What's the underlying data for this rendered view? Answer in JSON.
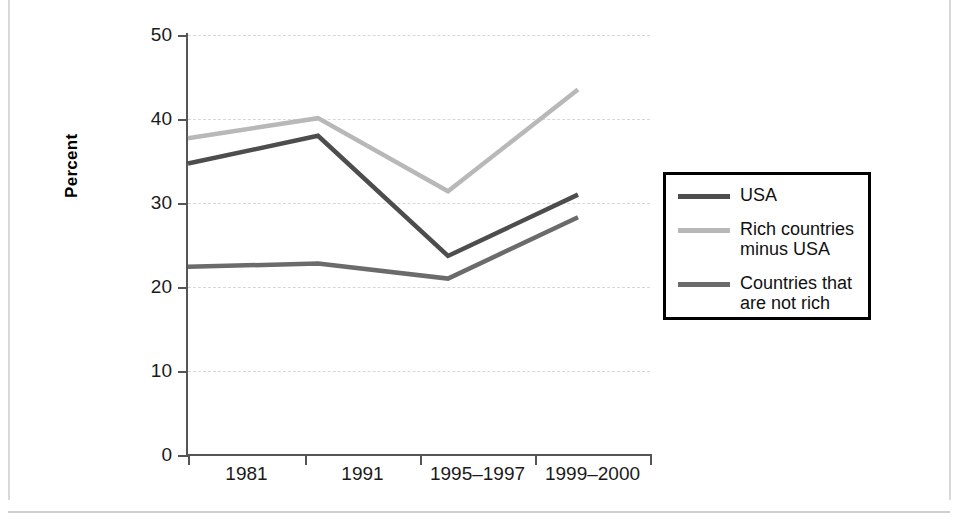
{
  "chart_data": {
    "type": "line",
    "title": "",
    "xlabel": "",
    "ylabel": "Percent",
    "categories": [
      "1981",
      "1991",
      "1995–1997",
      "1999–2000"
    ],
    "ylim": [
      0,
      50
    ],
    "yticks": [
      0,
      10,
      20,
      30,
      40,
      50
    ],
    "grid": true,
    "legend_position": "right",
    "series": [
      {
        "name": "USA",
        "color": "#4d4d4d",
        "values": [
          34.7,
          38.0,
          23.7,
          31.0
        ]
      },
      {
        "name": "Rich countries\nminus USA",
        "color": "#b8b8b8",
        "values": [
          37.7,
          40.1,
          31.4,
          43.5
        ]
      },
      {
        "name": "Countries that\nare not rich",
        "color": "#6b6b6b",
        "values": [
          22.4,
          22.8,
          21.0,
          28.3
        ]
      }
    ]
  },
  "axis": {
    "y_tick_labels": [
      "50",
      "40",
      "30",
      "20",
      "10",
      "0"
    ],
    "y_title": "Percent",
    "x_tick_labels": [
      "1981",
      "1991",
      "1995–1997",
      "1999–2000"
    ]
  },
  "legend": {
    "items": [
      {
        "label": "USA",
        "color": "#4d4d4d"
      },
      {
        "label": "Rich countries\nminus USA",
        "color": "#b8b8b8"
      },
      {
        "label": "Countries that\nare not rich",
        "color": "#6b6b6b"
      }
    ]
  }
}
